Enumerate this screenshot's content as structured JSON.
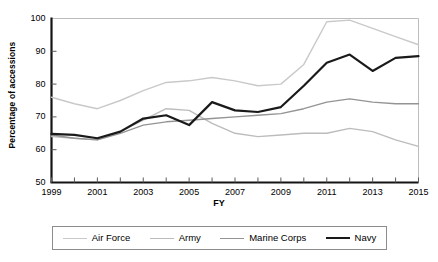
{
  "chart_data": {
    "type": "line",
    "title": "",
    "xlabel": "FY",
    "ylabel": "Percentage of accessions",
    "xlim": [
      1999,
      2015
    ],
    "ylim": [
      50,
      100
    ],
    "grid": false,
    "legend_position": "bottom",
    "x": [
      1999,
      2000,
      2001,
      2002,
      2003,
      2004,
      2005,
      2006,
      2007,
      2008,
      2009,
      2010,
      2011,
      2012,
      2013,
      2014,
      2015
    ],
    "x_tick_labels": [
      "1999",
      "2001",
      "2003",
      "2005",
      "2007",
      "2009",
      "2011",
      "2013",
      "2015"
    ],
    "y_tick_labels": [
      "50",
      "60",
      "70",
      "80",
      "90",
      "100"
    ],
    "series": [
      {
        "name": "Air Force",
        "color": "#c9c9c9",
        "width": 1.4,
        "values": [
          76,
          74,
          72.5,
          75,
          78,
          80.5,
          81,
          82,
          81,
          79.5,
          80,
          86,
          99,
          99.5,
          97,
          94.5,
          92
        ]
      },
      {
        "name": "Army",
        "color": "#bcbcbc",
        "width": 1.4,
        "values": [
          64,
          63.5,
          63,
          65.5,
          69,
          72.5,
          72,
          68,
          65,
          64,
          64.5,
          65,
          65,
          66.5,
          65.5,
          63,
          61
        ]
      },
      {
        "name": "Marine Corps",
        "color": "#949494",
        "width": 1.4,
        "values": [
          64.5,
          63.5,
          63,
          65,
          67.5,
          68.5,
          69,
          69.5,
          70,
          70.5,
          71,
          72.5,
          74.5,
          75.5,
          74.5,
          74,
          74
        ]
      },
      {
        "name": "Navy",
        "color": "#1a1a1a",
        "width": 2.2,
        "values": [
          64.8,
          64.5,
          63.5,
          65.5,
          69.5,
          70.5,
          67.5,
          74.5,
          72,
          71.5,
          73,
          79.5,
          86.5,
          89,
          84,
          88,
          88.5
        ]
      }
    ]
  },
  "axis": {
    "x_ticks": [
      {
        "label": "1999",
        "value": 1999
      },
      {
        "label": "2001",
        "value": 2001
      },
      {
        "label": "2003",
        "value": 2003
      },
      {
        "label": "2005",
        "value": 2005
      },
      {
        "label": "2007",
        "value": 2007
      },
      {
        "label": "2009",
        "value": 2009
      },
      {
        "label": "2011",
        "value": 2011
      },
      {
        "label": "2013",
        "value": 2013
      },
      {
        "label": "2015",
        "value": 2015
      }
    ],
    "y_ticks": [
      {
        "label": "100",
        "value": 100
      },
      {
        "label": "90",
        "value": 90
      },
      {
        "label": "80",
        "value": 80
      },
      {
        "label": "70",
        "value": 70
      },
      {
        "label": "60",
        "value": 60
      },
      {
        "label": "50",
        "value": 50
      }
    ]
  },
  "legend": {
    "items": [
      {
        "label": "Air Force",
        "color": "#c9c9c9",
        "width": 1.4
      },
      {
        "label": "Army",
        "color": "#bcbcbc",
        "width": 1.4
      },
      {
        "label": "Marine Corps",
        "color": "#949494",
        "width": 1.8
      },
      {
        "label": "Navy",
        "color": "#1a1a1a",
        "width": 2.6
      }
    ]
  }
}
